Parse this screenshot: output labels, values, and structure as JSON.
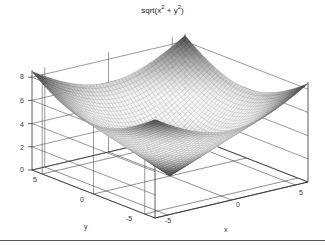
{
  "chart_data": {
    "type": "surface3d",
    "title_parts": {
      "prefix": "sqrt(x",
      "sup1": "2",
      "mid": " + y",
      "sup2": "2",
      "suffix": ")"
    },
    "function": "z = sqrt(x^2 + y^2)",
    "xlabel": "x",
    "ylabel": "y",
    "zlabel": "",
    "x_range": [
      -6,
      6
    ],
    "y_range": [
      -6,
      6
    ],
    "zlim": [
      0,
      8.5
    ],
    "grid_step": 0.25,
    "x_ticks": [
      "-5",
      "0",
      "5"
    ],
    "y_ticks": [
      "5",
      "0",
      "-5"
    ],
    "z_ticks": [
      "0",
      "2",
      "4",
      "6",
      "8"
    ],
    "grid": true,
    "colormap": "gray",
    "view": "3d perspective, origin vertex at front"
  }
}
